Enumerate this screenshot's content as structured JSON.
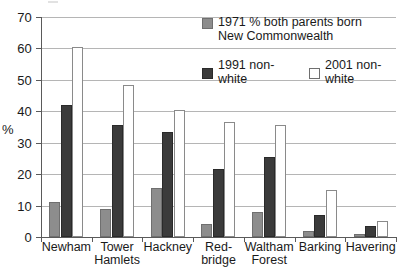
{
  "chart_data": {
    "type": "bar",
    "title": "",
    "xlabel": "",
    "ylabel": "%",
    "ylim": [
      0,
      70
    ],
    "yticks": [
      0,
      10,
      20,
      30,
      40,
      50,
      60,
      70
    ],
    "grid": true,
    "legend_position": "top-right inside plot",
    "categories": [
      "Newham",
      "Tower Hamlets",
      "Hackney",
      "Red-bridge",
      "Waltham Forest",
      "Barking",
      "Havering"
    ],
    "category_lines": [
      [
        "Newham"
      ],
      [
        "Tower",
        "Hamlets"
      ],
      [
        "Hackney"
      ],
      [
        "Red-",
        "bridge"
      ],
      [
        "Waltham",
        "Forest"
      ],
      [
        "Barking"
      ],
      [
        "Havering"
      ]
    ],
    "series": [
      {
        "name": "1971 % both parents born New Commonwealth",
        "key": "s1971",
        "color": "#8d8d8d",
        "values": [
          11,
          9,
          15.5,
          4,
          8,
          2,
          1
        ]
      },
      {
        "name": "1991 non-white",
        "key": "s1991",
        "color": "#3b3b3b",
        "values": [
          42,
          35.5,
          33.5,
          21.5,
          25.5,
          7,
          3.5
        ]
      },
      {
        "name": "2001 non-white",
        "key": "s2001",
        "color": "#ffffff",
        "values": [
          60.5,
          48.5,
          40.5,
          36.5,
          35.5,
          15,
          5
        ]
      }
    ]
  },
  "legend": {
    "item1_line1": "1971 % both parents born",
    "item1_line2": "New Commonwealth",
    "item2": "1991 non-white",
    "item3": "2001 non-white"
  },
  "axis": {
    "y_title": "%",
    "tick_70": "70",
    "tick_60": "60",
    "tick_50": "50",
    "tick_40": "40",
    "tick_30": "30",
    "tick_20": "20",
    "tick_10": "10",
    "tick_0": "0"
  },
  "categories": {
    "c0_l1": "Newham",
    "c1_l1": "Tower",
    "c1_l2": "Hamlets",
    "c2_l1": "Hackney",
    "c3_l1": "Red-",
    "c3_l2": "bridge",
    "c4_l1": "Waltham",
    "c4_l2": "Forest",
    "c5_l1": "Barking",
    "c6_l1": "Havering"
  }
}
